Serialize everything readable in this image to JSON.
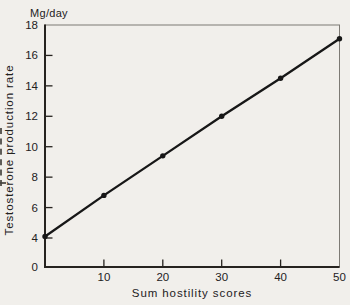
{
  "figure": {
    "unit_label": "Mg/day",
    "x_axis": {
      "title": "Sum hostility scores",
      "ticks": [
        10,
        20,
        30,
        40,
        50
      ]
    },
    "y_axis": {
      "title": "Testosterone production rate",
      "ticks": [
        18,
        16,
        14,
        12,
        10,
        8,
        6,
        4,
        0
      ]
    },
    "colors": {
      "background": "#f1efeb",
      "ink": "#26231f",
      "frame": "#7d7a74",
      "line": "#171717"
    }
  },
  "chart_data": {
    "type": "line",
    "title": "",
    "xlabel": "Sum hostility scores",
    "ylabel": "Testosterone production rate",
    "y_unit_label": "Mg/day",
    "x": [
      0,
      10,
      20,
      30,
      40,
      50
    ],
    "y": [
      4.1,
      6.8,
      9.4,
      12.0,
      14.5,
      17.1
    ],
    "xlim": [
      0,
      50
    ],
    "ylim": [
      0,
      18
    ],
    "y_tick_labels": [
      0,
      4,
      6,
      8,
      10,
      12,
      14,
      16,
      18
    ],
    "y_scale_break_between": [
      0,
      4
    ],
    "x_tick_labels": [
      10,
      20,
      30,
      40,
      50
    ],
    "marker": "filled-circle",
    "grid": false,
    "line_color": "#171717"
  }
}
